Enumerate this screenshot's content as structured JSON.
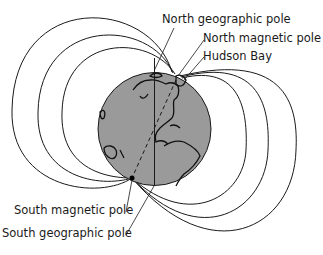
{
  "diagram": {
    "labels": {
      "north_geographic_pole": "North geographic pole",
      "north_magnetic_pole": "North magnetic pole",
      "hudson_bay": "Hudson Bay",
      "south_magnetic_pole": "South magnetic pole",
      "south_geographic_pole": "South geographic pole"
    },
    "colors": {
      "globe_fill": "#9a9a9a",
      "line": "#1a1a1a",
      "background": "#ffffff"
    }
  }
}
